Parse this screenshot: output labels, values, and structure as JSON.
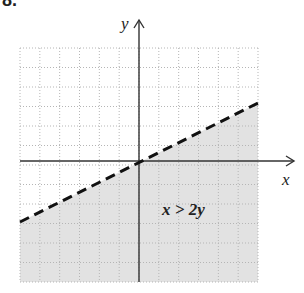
{
  "problem_number": "8.",
  "chart_data": {
    "type": "line",
    "title": "",
    "xlabel": "x",
    "ylabel": "y",
    "xlim": [
      -6,
      6
    ],
    "ylim": [
      -6,
      6
    ],
    "grid": true,
    "boundary_line": {
      "equation": "y = x/2",
      "style": "dashed",
      "points": [
        [
          -6,
          -3
        ],
        [
          6,
          3
        ]
      ]
    },
    "shaded_region": "below boundary line",
    "annotation": {
      "text": "x > 2y",
      "x": 2.5,
      "y": -2.4
    },
    "colors": {
      "shade": "#e2e2e2",
      "grid": "#b5b5b5",
      "axis": "#333333",
      "line": "#111111"
    }
  }
}
